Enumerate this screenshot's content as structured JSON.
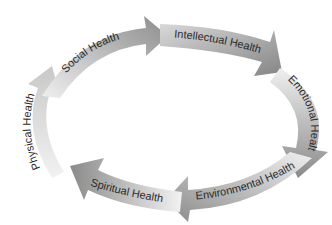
{
  "diagram": {
    "type": "cycle",
    "direction": "clockwise",
    "segments": [
      {
        "label": "Social Health"
      },
      {
        "label": "Intellectual Health"
      },
      {
        "label": "Emotional Health"
      },
      {
        "label": "Environmental Health"
      },
      {
        "label": "Spiritual Health"
      },
      {
        "label": "Physical Health"
      }
    ],
    "colors": {
      "arrow_light": "#eeeeee",
      "arrow_dark": "#8a8a8a",
      "text": "#2a2a2a",
      "background": "#ffffff"
    }
  }
}
